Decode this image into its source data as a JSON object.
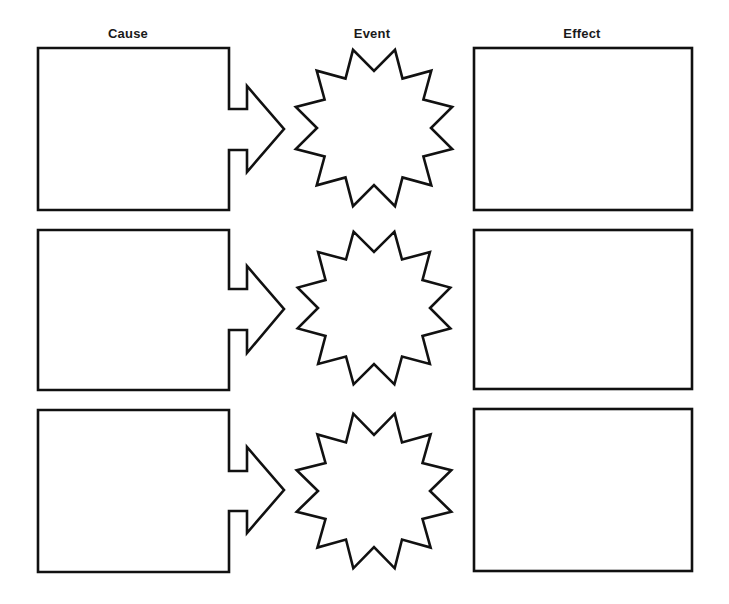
{
  "columns": [
    {
      "label": "Cause",
      "center_x": 128
    },
    {
      "label": "Event",
      "center_x": 372
    },
    {
      "label": "Effect",
      "center_x": 582
    }
  ],
  "colors": {
    "stroke": "#111111",
    "fill": "#ffffff",
    "background": "#ffffff",
    "text": "#1a1a1a"
  },
  "rows": [
    {
      "cause_box": {
        "x": 38,
        "y": 48,
        "right": 229,
        "bottom": 210
      },
      "arrow": {
        "stem_top": 109,
        "stem_bottom": 150,
        "neck_x": 247,
        "head_top": 86,
        "head_bottom": 172,
        "tip_x": 284,
        "tip_y": 129
      },
      "event_star": {
        "cx": 374,
        "cy": 128,
        "outer_r": 81,
        "inner_r": 57,
        "points": 12
      },
      "effect_box": {
        "x": 474,
        "y": 48,
        "right": 692,
        "bottom": 210
      },
      "cause_text": "",
      "event_text": "",
      "effect_text": ""
    },
    {
      "cause_box": {
        "x": 38,
        "y": 230,
        "right": 229,
        "bottom": 390
      },
      "arrow": {
        "stem_top": 289,
        "stem_bottom": 330,
        "neck_x": 247,
        "head_top": 266,
        "head_bottom": 353,
        "tip_x": 284,
        "tip_y": 309
      },
      "event_star": {
        "cx": 374,
        "cy": 308,
        "outer_r": 79,
        "inner_r": 56,
        "points": 12
      },
      "effect_box": {
        "x": 474,
        "y": 230,
        "right": 692,
        "bottom": 389
      },
      "cause_text": "",
      "event_text": "",
      "effect_text": ""
    },
    {
      "cause_box": {
        "x": 38,
        "y": 410,
        "right": 229,
        "bottom": 572
      },
      "arrow": {
        "stem_top": 471,
        "stem_bottom": 511,
        "neck_x": 247,
        "head_top": 447,
        "head_bottom": 533,
        "tip_x": 284,
        "tip_y": 490
      },
      "event_star": {
        "cx": 374,
        "cy": 491,
        "outer_r": 80,
        "inner_r": 56,
        "points": 12
      },
      "effect_box": {
        "x": 474,
        "y": 409,
        "right": 692,
        "bottom": 571
      },
      "cause_text": "",
      "event_text": "",
      "effect_text": ""
    }
  ]
}
